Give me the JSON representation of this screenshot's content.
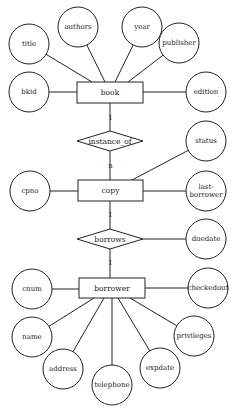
{
  "diagram": {
    "type": "er-diagram",
    "entities": [
      {
        "id": "book",
        "label": "book",
        "x": 77,
        "y": 82,
        "w": 66,
        "h": 21
      },
      {
        "id": "copy",
        "label": "copy",
        "x": 78,
        "y": 180,
        "w": 65,
        "h": 21
      },
      {
        "id": "borrower",
        "label": "borrower",
        "x": 79,
        "y": 278,
        "w": 66,
        "h": 20
      }
    ],
    "relationships": [
      {
        "id": "instance_of",
        "label": "instance_of",
        "cx": 110,
        "cy": 141,
        "hw": 33,
        "hh": 10
      },
      {
        "id": "borrows",
        "label": "borrows",
        "cx": 110,
        "cy": 239,
        "hw": 33,
        "hh": 10
      }
    ],
    "attributes": [
      {
        "id": "title",
        "label": "title",
        "lines": [
          "title"
        ],
        "cx": 29,
        "cy": 44,
        "r": 20,
        "entity": "book",
        "ax": 92,
        "ay": 82
      },
      {
        "id": "authors",
        "label": "authors",
        "lines": [
          "authors"
        ],
        "cx": 78,
        "cy": 27,
        "r": 20,
        "entity": "book",
        "ax": 105,
        "ay": 82
      },
      {
        "id": "year",
        "label": "year",
        "lines": [
          "year"
        ],
        "cx": 142,
        "cy": 27,
        "r": 20,
        "entity": "book",
        "ax": 115,
        "ay": 82
      },
      {
        "id": "publisher",
        "label": "publisher",
        "lines": [
          "publisher"
        ],
        "cx": 179,
        "cy": 43,
        "r": 20,
        "entity": "book",
        "ax": 128,
        "ay": 82
      },
      {
        "id": "bkid",
        "label": "bkid",
        "lines": [
          "bkid"
        ],
        "cx": 29,
        "cy": 92,
        "r": 20,
        "entity": "book",
        "ax": 77,
        "ay": 92
      },
      {
        "id": "edition",
        "label": "edition",
        "lines": [
          "edition"
        ],
        "cx": 206,
        "cy": 92,
        "r": 20,
        "entity": "book",
        "ax": 143,
        "ay": 92
      },
      {
        "id": "status",
        "label": "status",
        "lines": [
          "status"
        ],
        "cx": 206,
        "cy": 141,
        "r": 20,
        "entity": "copy",
        "ax": 132,
        "ay": 180
      },
      {
        "id": "cpno",
        "label": "cpno",
        "lines": [
          "cpno"
        ],
        "cx": 30,
        "cy": 191,
        "r": 20,
        "entity": "copy",
        "ax": 78,
        "ay": 191
      },
      {
        "id": "lastborrower",
        "label": "last-borrower",
        "lines": [
          "last-",
          "borrower"
        ],
        "cx": 206,
        "cy": 191,
        "r": 20,
        "entity": "copy",
        "ax": 143,
        "ay": 191
      },
      {
        "id": "duedate",
        "label": "duedate",
        "lines": [
          "duedate"
        ],
        "cx": 206,
        "cy": 239,
        "r": 20,
        "entity": "borrows",
        "ax": 143,
        "ay": 239
      },
      {
        "id": "cnum",
        "label": "cnum",
        "lines": [
          "cnum"
        ],
        "cx": 32,
        "cy": 289,
        "r": 20,
        "entity": "borrower",
        "ax": 79,
        "ay": 289
      },
      {
        "id": "checkedout",
        "label": "checkedout",
        "lines": [
          "checkedout"
        ],
        "cx": 208,
        "cy": 288,
        "r": 20,
        "entity": "borrower",
        "ax": 145,
        "ay": 288
      },
      {
        "id": "name",
        "label": "name",
        "lines": [
          "name"
        ],
        "cx": 32,
        "cy": 337,
        "r": 20,
        "entity": "borrower",
        "ax": 94,
        "ay": 298
      },
      {
        "id": "privileges",
        "label": "privileges",
        "lines": [
          "privileges"
        ],
        "cx": 194,
        "cy": 336,
        "r": 20,
        "entity": "borrower",
        "ax": 130,
        "ay": 298
      },
      {
        "id": "address",
        "label": "address",
        "lines": [
          "address"
        ],
        "cx": 63,
        "cy": 369,
        "r": 20,
        "entity": "borrower",
        "ax": 104,
        "ay": 298
      },
      {
        "id": "telephone",
        "label": "telephone",
        "lines": [
          "telephone"
        ],
        "cx": 112,
        "cy": 385,
        "r": 20,
        "entity": "borrower",
        "ax": 112,
        "ay": 298
      },
      {
        "id": "expdate",
        "label": "expdate",
        "lines": [
          "expdate"
        ],
        "cx": 160,
        "cy": 368,
        "r": 20,
        "entity": "borrower",
        "ax": 118,
        "ay": 298
      }
    ],
    "links": [
      {
        "from": "book",
        "to": "instance_of",
        "x1": 110,
        "y1": 103,
        "x2": 110,
        "y2": 131,
        "cardinality": "1",
        "cx": 110,
        "cy": 118
      },
      {
        "from": "instance_of",
        "to": "copy",
        "x1": 110,
        "y1": 151,
        "x2": 110,
        "y2": 180,
        "cardinality": "n",
        "cx": 110,
        "cy": 166
      },
      {
        "from": "copy",
        "to": "borrows",
        "x1": 110,
        "y1": 201,
        "x2": 110,
        "y2": 229,
        "cardinality": "1",
        "cx": 110,
        "cy": 215
      },
      {
        "from": "borrows",
        "to": "borrower",
        "x1": 110,
        "y1": 249,
        "x2": 110,
        "y2": 278,
        "cardinality": "1",
        "cx": 110,
        "cy": 263
      }
    ]
  }
}
